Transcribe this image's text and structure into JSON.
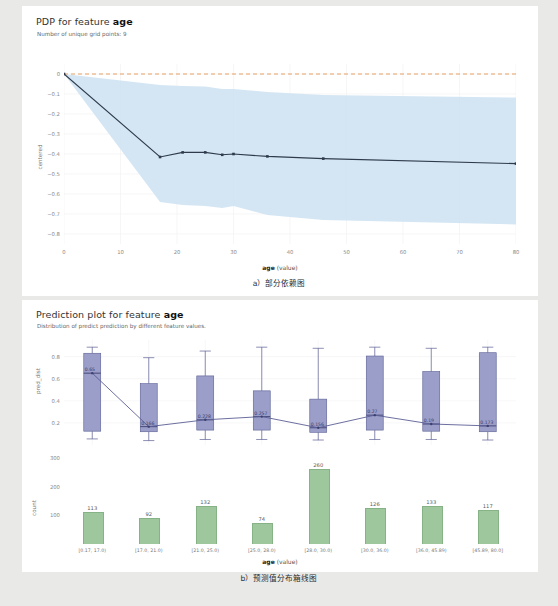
{
  "pdp": {
    "title_prefix": "PDP for feature ",
    "title_feature": "age",
    "subtitle": "Number of unique grid points: 9",
    "ylabel": "centered",
    "xlabel_bold": "age",
    "xlabel_rest": " (value)",
    "yticks": [
      "0",
      "−0.1",
      "−0.2",
      "−0.3",
      "−0.4",
      "−0.5",
      "−0.6",
      "−0.7",
      "−0.8"
    ],
    "xticks": [
      "0",
      "10",
      "20",
      "30",
      "40",
      "50",
      "60",
      "70",
      "80"
    ],
    "caption": "a）部分依赖图"
  },
  "pred": {
    "title_prefix": "Prediction plot for feature ",
    "title_feature": "age",
    "subtitle": "Distribution of predict prediction by different feature values.",
    "ylabel_box": "pred_dist",
    "ylabel_count": "count",
    "xlabel_bold": "age",
    "xlabel_rest": " (value)",
    "box_yticks": [
      "0.8",
      "0.6",
      "0.4",
      "0.2"
    ],
    "count_yticks": [
      "300",
      "200",
      "100"
    ],
    "caption": "b）预测值分布箱线图"
  },
  "chart_data": [
    {
      "type": "line",
      "title": "PDP for feature age",
      "subtitle": "Number of unique grid points: 9",
      "xlabel": "age (value)",
      "ylabel": "centered",
      "xlim": [
        0,
        80
      ],
      "ylim": [
        -0.85,
        0.05
      ],
      "grid": true,
      "zero_reference_line": 0,
      "x": [
        0,
        17,
        21,
        25,
        28,
        30,
        36,
        45.89,
        80
      ],
      "values": [
        0,
        -0.415,
        -0.392,
        -0.392,
        -0.404,
        -0.4,
        -0.412,
        -0.423,
        -0.448
      ],
      "band_upper": [
        0,
        -0.055,
        -0.06,
        -0.062,
        -0.075,
        -0.075,
        -0.09,
        -0.105,
        -0.118
      ],
      "band_lower": [
        0,
        -0.64,
        -0.655,
        -0.66,
        -0.67,
        -0.66,
        -0.705,
        -0.73,
        -0.752
      ],
      "band_label": "confidence band",
      "line_color": "#2f3b4c",
      "band_color": "#cfe3f2",
      "reference_color": "#e08a3c"
    },
    {
      "type": "box",
      "title": "Prediction plot for feature age",
      "subtitle": "Distribution of predict prediction by different feature values.",
      "xlabel": "age (value)",
      "ylabel": "pred_dist",
      "ylim": [
        0.0,
        0.95
      ],
      "categories": [
        "[0.17, 17.0)",
        "[17.0, 21.0)",
        "[21.0, 25.0)",
        "[25.0, 28.0)",
        "[28.0, 30.0)",
        "[30.0, 36.0)",
        "[36.0, 45.89)",
        "[45.89, 80.0]"
      ],
      "medians": [
        0.65,
        0.166,
        0.228,
        0.257,
        0.156,
        0.27,
        0.19,
        0.173
      ],
      "median_labels": [
        "0.65",
        "0.166",
        "0.228",
        "0.257",
        "0.156",
        "0.27",
        "0.19",
        "0.173"
      ],
      "q1": [
        0.125,
        0.12,
        0.135,
        0.135,
        0.115,
        0.135,
        0.125,
        0.12
      ],
      "q3": [
        0.83,
        0.555,
        0.625,
        0.49,
        0.415,
        0.805,
        0.665,
        0.835
      ],
      "whisker_low": [
        0.055,
        0.04,
        0.05,
        0.05,
        0.045,
        0.05,
        0.05,
        0.045
      ],
      "whisker_high": [
        0.885,
        0.79,
        0.85,
        0.885,
        0.875,
        0.885,
        0.875,
        0.885
      ],
      "box_color": "#9a9ec8",
      "line_color": "#5b5f94"
    },
    {
      "type": "bar",
      "xlabel": "age (value)",
      "ylabel": "count",
      "ylim": [
        0,
        320
      ],
      "categories": [
        "[0.17, 17.0)",
        "[17.0, 21.0)",
        "[21.0, 25.0)",
        "[25.0, 28.0)",
        "[28.0, 30.0)",
        "[30.0, 36.0)",
        "[36.0, 45.89)",
        "[45.89, 80.0]"
      ],
      "values": [
        113,
        92,
        132,
        74,
        260,
        126,
        133,
        117
      ],
      "bar_color": "#9ec79e"
    }
  ]
}
